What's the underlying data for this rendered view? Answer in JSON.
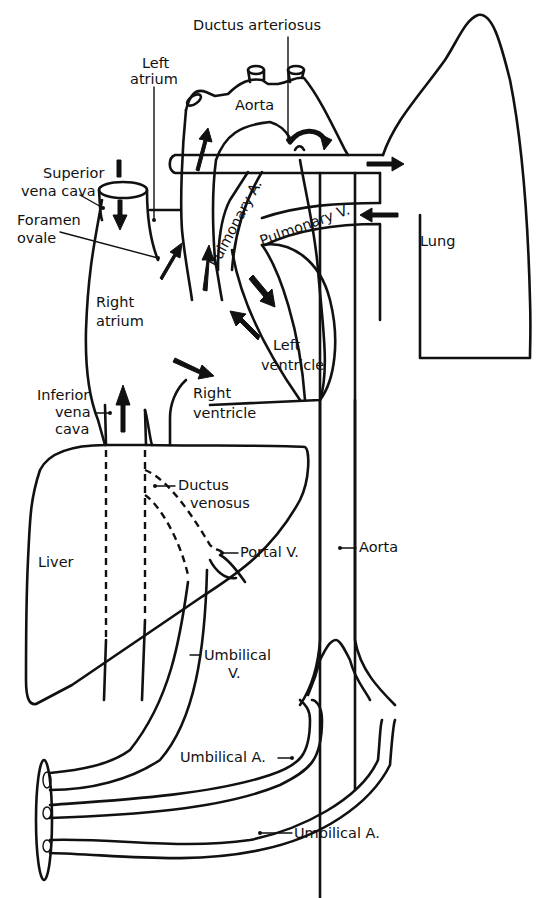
{
  "diagram": {
    "labels": {
      "ductus_arteriosus": "Ductus arteriosus",
      "aorta_top": "Aorta",
      "left_atrium_1": "Left",
      "left_atrium_2": "atrium",
      "superior_vena_cava_1": "Superior",
      "superior_vena_cava_2": "vena cava",
      "foramen_ovale_1": "Foramen",
      "foramen_ovale_2": "ovale",
      "pulmonary_artery": "Pulmonary A.",
      "pulmonary_vein": "Pulmonary V.",
      "lung": "Lung",
      "right_atrium_1": "Right",
      "right_atrium_2": "atrium",
      "left_ventricle_1": "Left",
      "left_ventricle_2": "ventricle",
      "right_ventricle_1": "Right",
      "right_ventricle_2": "ventricle",
      "inferior_vena_cava_1": "Inferior",
      "inferior_vena_cava_2": "vena",
      "inferior_vena_cava_3": "cava",
      "ductus_venosus_1": "Ductus",
      "ductus_venosus_2": "venosus",
      "liver": "Liver",
      "portal_vein": "Portal V.",
      "aorta_descending": "Aorta",
      "umbilical_vein_1": "Umbilical",
      "umbilical_vein_2": "V.",
      "umbilical_artery_upper": "Umbilical A.",
      "umbilical_artery_lower": "Umbilical A."
    },
    "colors": {
      "ink": "#111111",
      "background": "#ffffff"
    }
  }
}
